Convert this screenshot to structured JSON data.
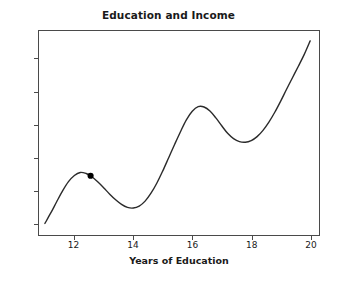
{
  "chart_data": {
    "type": "line",
    "title": "Education and Income",
    "xlabel": "Years of Education",
    "ylabel": "Lifetime Income",
    "xlim": [
      10.8,
      20.3
    ],
    "ylim": [
      -0.35,
      5.85
    ],
    "xticks": [
      12,
      14,
      16,
      18,
      20
    ],
    "xticklabels": [
      "12",
      "14",
      "16",
      "18",
      "20"
    ],
    "yticks": [
      0,
      1,
      2,
      3,
      4,
      5
    ],
    "yticklabels": [
      "0",
      "1",
      "2",
      "3",
      "4",
      "5"
    ],
    "grid": false,
    "legend": null,
    "line_color": "#2b2b2b",
    "line_width": 1.4,
    "series": [
      {
        "name": "Lifetime Income",
        "x": [
          11.0,
          11.2,
          11.4,
          11.6,
          11.8,
          12.0,
          12.2,
          12.4,
          12.55,
          12.8,
          13.0,
          13.2,
          13.4,
          13.6,
          13.8,
          14.0,
          14.2,
          14.4,
          14.6,
          14.8,
          15.0,
          15.2,
          15.4,
          15.6,
          15.8,
          16.0,
          16.2,
          16.4,
          16.6,
          16.8,
          17.0,
          17.2,
          17.4,
          17.6,
          17.8,
          18.0,
          18.2,
          18.4,
          18.6,
          18.8,
          19.0,
          19.2,
          19.4,
          19.6,
          19.8,
          20.0
        ],
        "y": [
          0.0,
          0.32,
          0.66,
          0.99,
          1.27,
          1.46,
          1.55,
          1.52,
          1.45,
          1.26,
          1.08,
          0.89,
          0.72,
          0.58,
          0.49,
          0.47,
          0.53,
          0.68,
          0.92,
          1.23,
          1.6,
          2.0,
          2.4,
          2.79,
          3.15,
          3.41,
          3.55,
          3.54,
          3.42,
          3.21,
          2.97,
          2.74,
          2.58,
          2.49,
          2.47,
          2.52,
          2.64,
          2.83,
          3.08,
          3.38,
          3.72,
          4.08,
          4.43,
          4.78,
          5.14,
          5.55
        ]
      }
    ],
    "markers": [
      {
        "name": "highlight-point",
        "x": 12.55,
        "y": 1.45,
        "color": "#000000",
        "size": 5
      }
    ],
    "annotations": {
      "first_peak": {
        "x": 12.2,
        "y": 1.55
      },
      "first_trough": {
        "x": 13.85,
        "y": 0.47
      },
      "second_peak": {
        "x": 16.2,
        "y": 3.55
      },
      "second_trough": {
        "x": 17.8,
        "y": 2.47
      },
      "end_point": {
        "x": 20.0,
        "y": 5.55
      }
    }
  }
}
